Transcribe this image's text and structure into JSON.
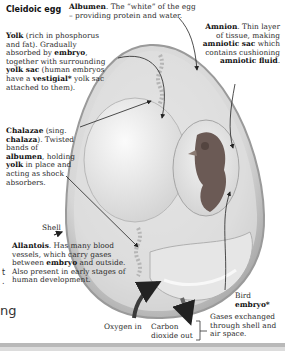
{
  "diagram": {
    "title": "Cleidoic egg",
    "labels": {
      "albumen": {
        "term": "Albumen",
        "text": ". The “white” of the egg – providing protein and water."
      },
      "yolk": {
        "term": "Yolk",
        "text1": " (rich in phosphorus and fat). Gradually absorbed by ",
        "term2": "embryo",
        "text2": ", together with surrounding ",
        "term3": "yolk sac",
        "text3": " (human embryos have a ",
        "term4": "vestigial*",
        "text4": " yolk sac attached to them)."
      },
      "amnion": {
        "term": "Amnion",
        "text1": ". Thin layer of tissue, making ",
        "term2": "amniotic sac",
        "text2": " which contains cushioning ",
        "term3": "amniotic fluid",
        "text3": "."
      },
      "chalazae": {
        "term": "Chalazae",
        "text1": " (sing. ",
        "term2": "chalaza",
        "text2": "). Twisted bands of ",
        "term3": "albumen",
        "text3": ", holding ",
        "term4": "yolk",
        "text4": " in place and acting as shock absorbers."
      },
      "shell": {
        "text": "Shell"
      },
      "allantois": {
        "term": "Allantois",
        "text1": ". Has many blood vessels, which carry gases between ",
        "term2": "embryo",
        "text2": " and outside. Also present in early stages of human development."
      },
      "bird_embryo": {
        "text": "Bird",
        "term": "embryo*"
      },
      "oxygen_in": {
        "text": "Oxygen in"
      },
      "co2_out": {
        "text": "Carbon dioxide out"
      },
      "gases": {
        "text": "Gases exchanged through shell and air space."
      }
    },
    "edge_fragments": {
      "left_t": "t",
      "left_dot": ".",
      "left_ng": "ng"
    },
    "colors": {
      "shell_outer": "#c9c9c9",
      "albumen": "#dedede",
      "yolk": "#ececec",
      "embryo": "#6b5a55",
      "arrow": "#3a3a3a"
    }
  }
}
